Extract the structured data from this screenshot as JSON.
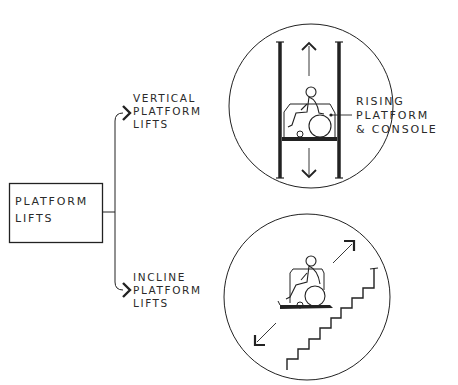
{
  "diagram": {
    "root": {
      "label_lines": [
        "PLATFORM",
        "LIFTS"
      ]
    },
    "branches": [
      {
        "id": "vertical",
        "label_lines": [
          "VERTICAL",
          "PLATFORM",
          "LIFTS"
        ],
        "illustration": "wheelchair-user-on-vertical-lift-with-up-down-arrows"
      },
      {
        "id": "incline",
        "label_lines": [
          "INCLINE",
          "PLATFORM",
          "LIFTS"
        ],
        "illustration": "wheelchair-user-on-inclined-lift-along-stairs-with-diagonal-arrows"
      }
    ],
    "callout": {
      "label_lines": [
        "RISING",
        "PLATFORM",
        "& CONSOLE"
      ],
      "points_to": "vertical-lift-platform"
    },
    "colors": {
      "ink": "#222222",
      "background": "#ffffff"
    }
  }
}
